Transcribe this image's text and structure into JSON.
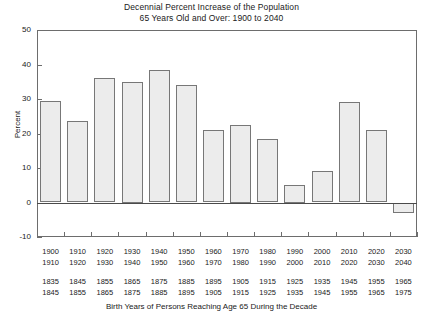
{
  "chart_data": {
    "type": "bar",
    "title": "Decennial Percent Increase of the Population 65 Years Old and Over:  1900 to 2040",
    "title_lines": [
      "Decennial Percent Increase of the Population",
      "65 Years Old and Over:  1900 to 2040"
    ],
    "xlabel": "Birth Years of Persons Reaching Age 65 During the Decade",
    "ylabel": "Percent",
    "ylim": [
      -10,
      50
    ],
    "yticks": [
      50,
      40,
      30,
      20,
      10,
      0,
      -10
    ],
    "ytick_labels": [
      "50",
      "40",
      "30",
      "20",
      "10",
      "0",
      "-10"
    ],
    "grid": false,
    "legend": "none",
    "categories": [
      "1900\n1910",
      "1910\n1920",
      "1920\n1930",
      "1930\n1940",
      "1940\n1950",
      "1950\n1960",
      "1960\n1970",
      "1970\n1980",
      "1980\n1990",
      "1990\n2000",
      "2000\n2010",
      "2010\n2020",
      "2020\n2030",
      "2030\n2040"
    ],
    "decade_labels": [
      {
        "start": "1900",
        "end": "1910"
      },
      {
        "start": "1910",
        "end": "1920"
      },
      {
        "start": "1920",
        "end": "1930"
      },
      {
        "start": "1930",
        "end": "1940"
      },
      {
        "start": "1940",
        "end": "1950"
      },
      {
        "start": "1950",
        "end": "1960"
      },
      {
        "start": "1960",
        "end": "1970"
      },
      {
        "start": "1970",
        "end": "1980"
      },
      {
        "start": "1980",
        "end": "1990"
      },
      {
        "start": "1990",
        "end": "2000"
      },
      {
        "start": "2000",
        "end": "2010"
      },
      {
        "start": "2010",
        "end": "2020"
      },
      {
        "start": "2020",
        "end": "2030"
      },
      {
        "start": "2030",
        "end": "2040"
      }
    ],
    "birth_year_labels": [
      {
        "start": "1835",
        "end": "1845"
      },
      {
        "start": "1845",
        "end": "1855"
      },
      {
        "start": "1855",
        "end": "1865"
      },
      {
        "start": "1865",
        "end": "1875"
      },
      {
        "start": "1875",
        "end": "1885"
      },
      {
        "start": "1885",
        "end": "1895"
      },
      {
        "start": "1895",
        "end": "1905"
      },
      {
        "start": "1905",
        "end": "1915"
      },
      {
        "start": "1915",
        "end": "1925"
      },
      {
        "start": "1925",
        "end": "1935"
      },
      {
        "start": "1935",
        "end": "1945"
      },
      {
        "start": "1945",
        "end": "1955"
      },
      {
        "start": "1955",
        "end": "1965"
      },
      {
        "start": "1965",
        "end": "1975"
      }
    ],
    "values": [
      29.5,
      23.5,
      36,
      35,
      38.5,
      34,
      21,
      22.5,
      18.5,
      5,
      9,
      29,
      21,
      -3
    ],
    "bar_fill": "#ececec",
    "bar_edge": "#777777",
    "axis_color": "#6d6d6d",
    "text_color": "#1a1a1a"
  }
}
